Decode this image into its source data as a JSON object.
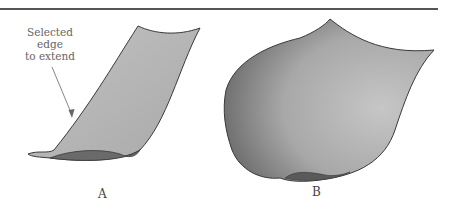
{
  "figure": {
    "callout_lines": [
      "Selected",
      "edge",
      "to extend"
    ],
    "panel_labels": [
      "A",
      "B"
    ],
    "colors": {
      "surface_light": "#b9b9b9",
      "surface_dark": "#6e6e6e",
      "outline": "#3a3a3a",
      "rule": "#555555"
    }
  }
}
